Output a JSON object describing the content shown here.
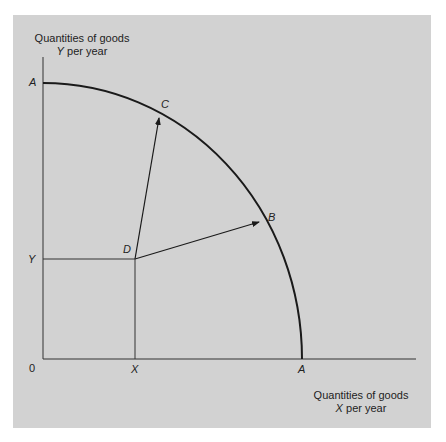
{
  "diagram": {
    "type": "production-possibility-frontier",
    "y_axis_title": {
      "line1": "Quantities of goods",
      "line2_var": "Y",
      "line2_rest": " per year"
    },
    "x_axis_title": {
      "line1": "Quantities of goods",
      "line2_var": "X",
      "line2_rest": " per year"
    },
    "labels": {
      "origin": "0",
      "y_intercept": "A",
      "x_intercept": "A",
      "point_c": "C",
      "point_b": "B",
      "point_d": "D",
      "y_level": "Y",
      "x_level": "X"
    },
    "colors": {
      "background": "#d2d2d2",
      "line": "#1a1a1a"
    }
  }
}
